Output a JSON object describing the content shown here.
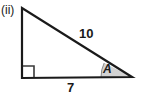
{
  "figure": {
    "part_label": "(ii)",
    "shape": "right triangle",
    "side_labels": {
      "hypotenuse": "10",
      "base": "7"
    },
    "angle_label": "A",
    "right_angle_marker": "right-angle-square",
    "colors": {
      "stroke": "#1a1a1a",
      "angle_fill": "#d2d2d2",
      "angle_stroke": "#8a8a8a",
      "background": "#ffffff",
      "text": "#1a1a1a"
    },
    "geometry": {
      "apex": [
        22,
        8
      ],
      "bottom_left": [
        22,
        78
      ],
      "bottom_right": [
        132,
        77
      ]
    }
  }
}
